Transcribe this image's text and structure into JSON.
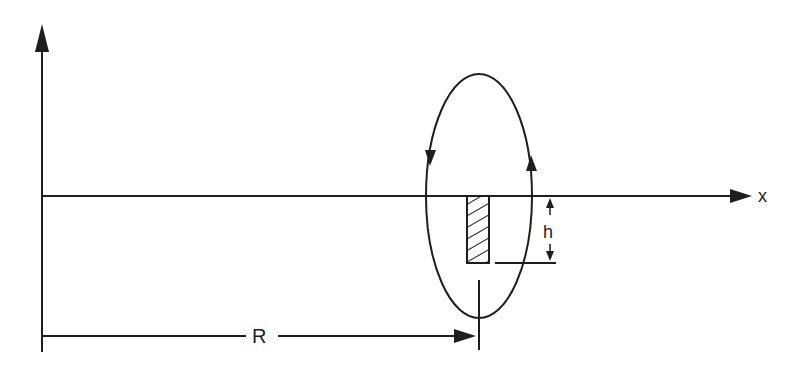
{
  "diagram": {
    "labels": {
      "x_axis": "x",
      "radius": "R",
      "height": "h"
    },
    "colors": {
      "line": "#1e1e1e",
      "background": "#ffffff"
    },
    "elements": {
      "vertical_axis": "arrow-up",
      "horizontal_axis": "arrow-right",
      "loop": "ellipse with circulation arrows (left down, right up)",
      "hatched_block": "rectangle below x-axis",
      "dimension_h": "double arrow",
      "dimension_R": "arrow from axis to loop center"
    }
  }
}
